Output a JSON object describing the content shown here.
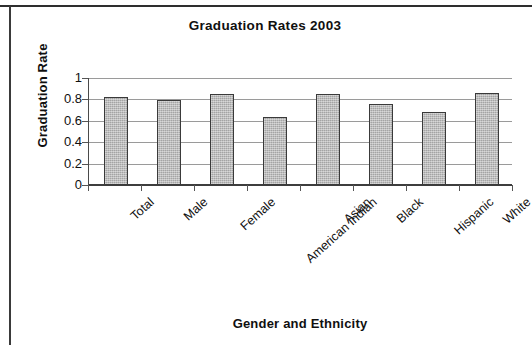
{
  "chart_data": {
    "type": "bar",
    "title": "Graduation Rates 2003",
    "xlabel": "Gender and Ethnicity",
    "ylabel": "Graduation Rate",
    "categories": [
      "Total",
      "Male",
      "Female",
      "American Indian",
      "Asian",
      "Black",
      "Hispanic",
      "White"
    ],
    "values": [
      0.82,
      0.79,
      0.85,
      0.64,
      0.85,
      0.76,
      0.68,
      0.86
    ],
    "ylim": [
      0,
      1
    ],
    "ytick_labels": [
      "1",
      "0.8",
      "0.6",
      "0.4",
      "0.2",
      "0"
    ],
    "ytick_values": [
      1,
      0.8,
      0.6,
      0.4,
      0.2,
      0
    ],
    "grid": true,
    "legend": false,
    "legend_position": "none",
    "series": [
      {
        "name": "Graduation Rate",
        "values": [
          0.82,
          0.79,
          0.85,
          0.64,
          0.85,
          0.76,
          0.68,
          0.86
        ]
      }
    ],
    "colors": {
      "bar_fill": "#b6b6b6",
      "bar_border": "#3a3a3a",
      "gridline": "#9a9a9a",
      "axis": "#3d3d3d",
      "text": "#101010"
    }
  }
}
